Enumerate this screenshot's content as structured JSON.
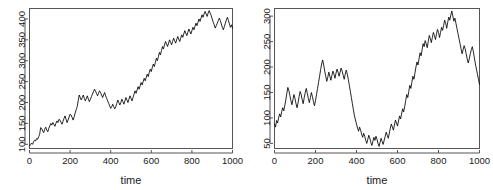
{
  "figure": {
    "background_color": "#ffffff",
    "panel_count": 2,
    "line_color": "#000000",
    "axis_color": "#555555"
  },
  "chart_data": [
    {
      "type": "line",
      "title": "",
      "subtitle": "",
      "xlabel": "time",
      "ylabel": "",
      "panel": "left",
      "grid": false,
      "legend": false,
      "xlim": [
        0,
        1000
      ],
      "ylim": [
        90,
        425
      ],
      "xticks": [
        0,
        200,
        400,
        600,
        800,
        1000
      ],
      "yticks": [
        100,
        150,
        200,
        250,
        300,
        350,
        400
      ],
      "xtick_labels": [
        "0",
        "200",
        "400",
        "600",
        "800",
        "1000"
      ],
      "ytick_labels": [
        "100",
        "150",
        "200",
        "250",
        "300",
        "350",
        "400"
      ],
      "series": [
        {
          "name": "random walk 1",
          "x": [
            0,
            5,
            10,
            15,
            20,
            25,
            30,
            35,
            40,
            45,
            50,
            55,
            60,
            65,
            70,
            75,
            80,
            85,
            90,
            95,
            100,
            105,
            110,
            115,
            120,
            125,
            130,
            135,
            140,
            145,
            150,
            155,
            160,
            165,
            170,
            175,
            180,
            185,
            190,
            195,
            200,
            205,
            210,
            215,
            220,
            225,
            230,
            235,
            240,
            245,
            250,
            255,
            260,
            265,
            270,
            275,
            280,
            285,
            290,
            295,
            300,
            305,
            310,
            315,
            320,
            325,
            330,
            335,
            340,
            345,
            350,
            355,
            360,
            365,
            370,
            375,
            380,
            385,
            390,
            395,
            400,
            405,
            410,
            415,
            420,
            425,
            430,
            435,
            440,
            445,
            450,
            455,
            460,
            465,
            470,
            475,
            480,
            485,
            490,
            495,
            500,
            505,
            510,
            515,
            520,
            525,
            530,
            535,
            540,
            545,
            550,
            555,
            560,
            565,
            570,
            575,
            580,
            585,
            590,
            595,
            600,
            605,
            610,
            615,
            620,
            625,
            630,
            635,
            640,
            645,
            650,
            655,
            660,
            665,
            670,
            675,
            680,
            685,
            690,
            695,
            700,
            705,
            710,
            715,
            720,
            725,
            730,
            735,
            740,
            745,
            750,
            755,
            760,
            765,
            770,
            775,
            780,
            785,
            790,
            795,
            800,
            805,
            810,
            815,
            820,
            825,
            830,
            835,
            840,
            845,
            850,
            855,
            860,
            865,
            870,
            875,
            880,
            885,
            890,
            895,
            900,
            905,
            910,
            915,
            920,
            925,
            930,
            935,
            940,
            945,
            950,
            955,
            960,
            965,
            970,
            975,
            980,
            985,
            990,
            995,
            1000
          ],
          "y": [
            96,
            99,
            103,
            100,
            106,
            110,
            108,
            114,
            112,
            118,
            124,
            140,
            138,
            132,
            128,
            136,
            141,
            134,
            130,
            138,
            144,
            150,
            146,
            152,
            148,
            143,
            150,
            156,
            152,
            160,
            158,
            153,
            148,
            155,
            162,
            168,
            160,
            152,
            158,
            165,
            172,
            170,
            164,
            158,
            166,
            175,
            183,
            190,
            205,
            218,
            212,
            206,
            212,
            218,
            210,
            204,
            210,
            216,
            208,
            202,
            208,
            214,
            220,
            226,
            232,
            228,
            222,
            216,
            222,
            228,
            224,
            218,
            212,
            218,
            224,
            216,
            210,
            204,
            198,
            192,
            186,
            190,
            196,
            190,
            185,
            190,
            198,
            206,
            200,
            194,
            200,
            208,
            202,
            196,
            204,
            212,
            206,
            200,
            208,
            216,
            210,
            204,
            212,
            220,
            228,
            222,
            230,
            238,
            232,
            240,
            248,
            242,
            250,
            258,
            252,
            260,
            268,
            262,
            272,
            280,
            274,
            284,
            292,
            286,
            296,
            306,
            300,
            310,
            320,
            314,
            324,
            334,
            328,
            338,
            346,
            340,
            334,
            342,
            350,
            344,
            338,
            346,
            354,
            348,
            342,
            350,
            358,
            352,
            346,
            354,
            362,
            356,
            364,
            372,
            366,
            360,
            368,
            376,
            370,
            364,
            372,
            380,
            374,
            382,
            390,
            384,
            392,
            400,
            394,
            402,
            410,
            404,
            412,
            418,
            412,
            406,
            414,
            420,
            414,
            408,
            400,
            392,
            386,
            378,
            384,
            390,
            396,
            402,
            396,
            388,
            380,
            374,
            382,
            390,
            398,
            404,
            396,
            388,
            380,
            386,
            378
          ]
        }
      ]
    },
    {
      "type": "line",
      "title": "",
      "subtitle": "",
      "xlabel": "time",
      "ylabel": "",
      "panel": "right",
      "grid": false,
      "legend": false,
      "xlim": [
        0,
        1000
      ],
      "ylim": [
        40,
        315
      ],
      "xticks": [
        0,
        200,
        400,
        600,
        800,
        1000
      ],
      "yticks": [
        50,
        100,
        150,
        200,
        250,
        300
      ],
      "xtick_labels": [
        "0",
        "200",
        "400",
        "600",
        "800",
        "1000"
      ],
      "ytick_labels": [
        "50",
        "100",
        "150",
        "200",
        "250",
        "300"
      ],
      "series": [
        {
          "name": "random walk 2",
          "x": [
            0,
            5,
            10,
            15,
            20,
            25,
            30,
            35,
            40,
            45,
            50,
            55,
            60,
            65,
            70,
            75,
            80,
            85,
            90,
            95,
            100,
            105,
            110,
            115,
            120,
            125,
            130,
            135,
            140,
            145,
            150,
            155,
            160,
            165,
            170,
            175,
            180,
            185,
            190,
            195,
            200,
            205,
            210,
            215,
            220,
            225,
            230,
            235,
            240,
            245,
            250,
            255,
            260,
            265,
            270,
            275,
            280,
            285,
            290,
            295,
            300,
            305,
            310,
            315,
            320,
            325,
            330,
            335,
            340,
            345,
            350,
            355,
            360,
            365,
            370,
            375,
            380,
            385,
            390,
            395,
            400,
            405,
            410,
            415,
            420,
            425,
            430,
            435,
            440,
            445,
            450,
            455,
            460,
            465,
            470,
            475,
            480,
            485,
            490,
            495,
            500,
            505,
            510,
            515,
            520,
            525,
            530,
            535,
            540,
            545,
            550,
            555,
            560,
            565,
            570,
            575,
            580,
            585,
            590,
            595,
            600,
            605,
            610,
            615,
            620,
            625,
            630,
            635,
            640,
            645,
            650,
            655,
            660,
            665,
            670,
            675,
            680,
            685,
            690,
            695,
            700,
            705,
            710,
            715,
            720,
            725,
            730,
            735,
            740,
            745,
            750,
            755,
            760,
            765,
            770,
            775,
            780,
            785,
            790,
            795,
            800,
            805,
            810,
            815,
            820,
            825,
            830,
            835,
            840,
            845,
            850,
            855,
            860,
            865,
            870,
            875,
            880,
            885,
            890,
            895,
            900,
            905,
            910,
            915,
            920,
            925,
            930,
            935,
            940,
            945,
            950,
            955,
            960,
            965,
            970,
            975,
            980,
            985,
            990,
            995,
            1000
          ],
          "y": [
            88,
            82,
            95,
            90,
            100,
            108,
            102,
            112,
            120,
            114,
            124,
            135,
            148,
            160,
            154,
            144,
            134,
            126,
            136,
            146,
            138,
            128,
            120,
            130,
            142,
            152,
            146,
            136,
            128,
            140,
            150,
            158,
            148,
            138,
            130,
            140,
            150,
            142,
            132,
            124,
            134,
            146,
            158,
            170,
            182,
            195,
            206,
            214,
            204,
            192,
            182,
            172,
            180,
            190,
            182,
            174,
            184,
            192,
            186,
            178,
            188,
            196,
            190,
            182,
            190,
            198,
            192,
            184,
            176,
            186,
            194,
            186,
            176,
            164,
            152,
            140,
            128,
            116,
            104,
            96,
            88,
            80,
            74,
            82,
            76,
            68,
            62,
            70,
            64,
            56,
            50,
            58,
            66,
            60,
            52,
            46,
            54,
            62,
            56,
            64,
            58,
            50,
            44,
            52,
            60,
            54,
            48,
            56,
            64,
            72,
            66,
            60,
            70,
            80,
            88,
            82,
            76,
            86,
            96,
            90,
            84,
            94,
            104,
            98,
            108,
            118,
            112,
            122,
            134,
            146,
            140,
            152,
            164,
            158,
            170,
            182,
            176,
            188,
            200,
            210,
            204,
            216,
            228,
            222,
            234,
            246,
            240,
            252,
            246,
            238,
            250,
            262,
            256,
            248,
            258,
            268,
            262,
            254,
            264,
            274,
            268,
            258,
            268,
            278,
            272,
            282,
            292,
            286,
            276,
            288,
            298,
            292,
            302,
            310,
            300,
            290,
            296,
            286,
            276,
            266,
            256,
            246,
            236,
            226,
            234,
            242,
            236,
            226,
            216,
            208,
            216,
            226,
            234,
            240,
            230,
            218,
            206,
            196,
            186,
            176,
            166,
            158
          ]
        }
      ]
    }
  ]
}
